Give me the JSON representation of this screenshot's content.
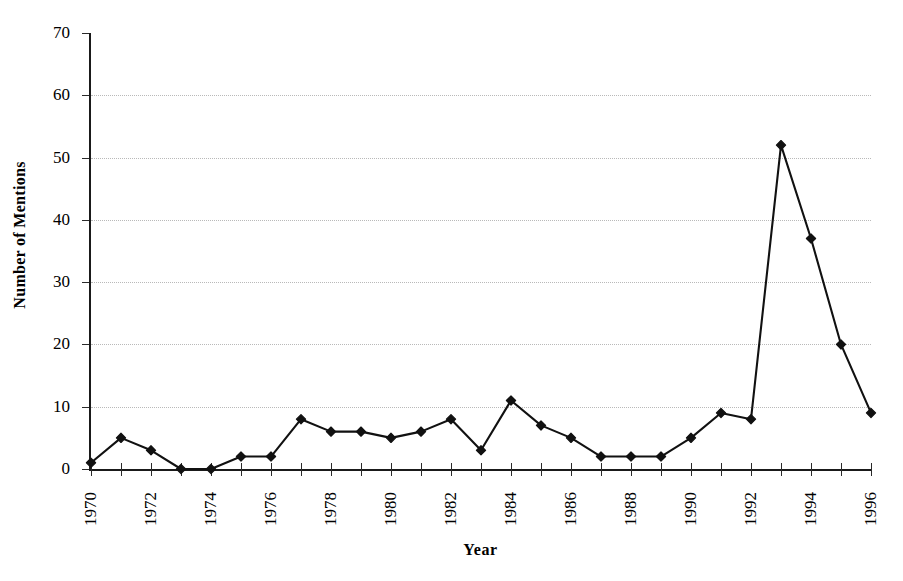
{
  "chart_data": {
    "type": "line",
    "title": "",
    "xlabel": "Year",
    "ylabel": "Number of Mentions",
    "x": [
      1970,
      1971,
      1972,
      1973,
      1974,
      1975,
      1976,
      1977,
      1978,
      1979,
      1980,
      1981,
      1982,
      1983,
      1984,
      1985,
      1986,
      1987,
      1988,
      1989,
      1990,
      1991,
      1992,
      1993,
      1994,
      1995,
      1996
    ],
    "values": [
      1,
      5,
      3,
      0,
      0,
      2,
      2,
      8,
      6,
      6,
      5,
      6,
      8,
      3,
      11,
      7,
      5,
      2,
      2,
      2,
      5,
      9,
      8,
      52,
      37,
      20,
      9
    ],
    "series": [
      {
        "name": "Number of Mentions",
        "values": [
          1,
          5,
          3,
          0,
          0,
          2,
          2,
          8,
          6,
          6,
          5,
          6,
          8,
          3,
          11,
          7,
          5,
          2,
          2,
          2,
          5,
          9,
          8,
          52,
          37,
          20,
          9
        ]
      }
    ],
    "xlim": [
      1970,
      1996
    ],
    "ylim": [
      0,
      70
    ],
    "yticks": [
      0,
      10,
      20,
      30,
      40,
      50,
      60,
      70
    ],
    "ytick_labels": [
      "0",
      "10",
      "20",
      "30",
      "40",
      "50",
      "60",
      "70"
    ],
    "xticks": [
      1970,
      1971,
      1972,
      1973,
      1974,
      1975,
      1976,
      1977,
      1978,
      1979,
      1980,
      1981,
      1982,
      1983,
      1984,
      1985,
      1986,
      1987,
      1988,
      1989,
      1990,
      1991,
      1992,
      1993,
      1994,
      1995,
      1996
    ],
    "xtick_labels": [
      "1970",
      "",
      "1972",
      "",
      "1974",
      "",
      "1976",
      "",
      "1978",
      "",
      "1980",
      "",
      "1982",
      "",
      "1984",
      "",
      "1986",
      "",
      "1988",
      "",
      "1990",
      "",
      "1992",
      "",
      "1994",
      "",
      "1996"
    ],
    "grid": true,
    "grid_axis": "y",
    "legend": false,
    "marker": "diamond",
    "line_color": "#111111",
    "marker_color": "#111111",
    "grid_color": "#b9b9b9",
    "axis_color": "#1a1a1a",
    "background": "#ffffff"
  }
}
